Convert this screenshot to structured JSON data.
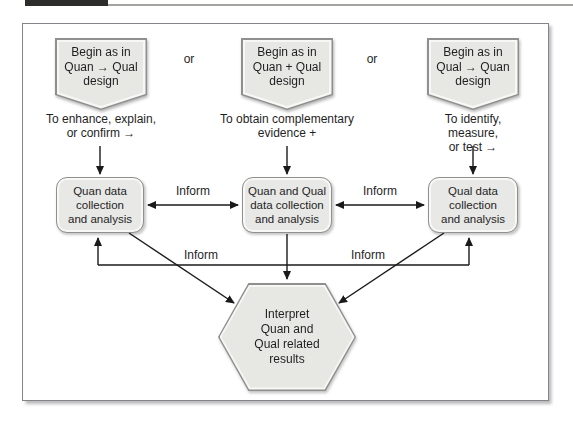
{
  "colors": {
    "background": "#ffffff",
    "shape_fill": "#e7e7e4",
    "shape_border": "#8f8f8d",
    "shape_inner_highlight": "#f7f7f5",
    "line": "#1a1a1a",
    "text": "#1f1f1f",
    "header_bar": "#2d2d2b"
  },
  "diagram": {
    "or_labels": [
      "or",
      "or"
    ],
    "columns": [
      {
        "banner_lines": [
          "Begin as in",
          "Quan → Qual",
          "design"
        ],
        "caption_lines": [
          "To enhance, explain,",
          "or confirm  →"
        ],
        "box_lines": [
          "Quan data",
          "collection",
          "and analysis"
        ]
      },
      {
        "banner_lines": [
          "Begin as in",
          "Quan + Qual",
          "design"
        ],
        "caption_lines": [
          "To obtain complementary",
          "evidence +"
        ],
        "box_lines": [
          "Quan and Qual",
          "data collection",
          "and analysis"
        ]
      },
      {
        "banner_lines": [
          "Begin as in",
          "Qual → Quan",
          "design"
        ],
        "caption_lines": [
          "To identify, measure,",
          "or test  →"
        ],
        "box_lines": [
          "Qual data",
          "collection",
          "and analysis"
        ]
      }
    ],
    "inform_labels": {
      "between_left_middle": "Inform",
      "between_middle_right": "Inform",
      "feedback_left": "Inform",
      "feedback_right": "Inform"
    },
    "hexagon_lines": [
      "Interpret",
      "Quan and",
      "Qual related",
      "results"
    ]
  }
}
